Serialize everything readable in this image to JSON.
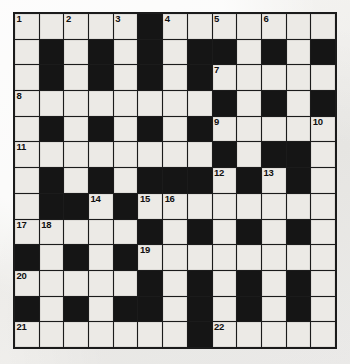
{
  "puzzle": {
    "title": "Crossword Grid",
    "type": "crossword",
    "rows": 13,
    "cols": 13,
    "colors": {
      "block": "#151515",
      "open_cell": "#eceae6",
      "border": "#1b1b1b",
      "page_background": "#f2f1ef",
      "number_text": "#101010"
    },
    "legend": {
      "open": "0 = open (white) cell where a letter is written",
      "block": "1 = blocked (black) cell"
    },
    "grid": [
      [
        0,
        0,
        0,
        0,
        0,
        1,
        0,
        0,
        0,
        0,
        0,
        0,
        0
      ],
      [
        0,
        1,
        0,
        1,
        0,
        1,
        0,
        1,
        1,
        0,
        1,
        0,
        1
      ],
      [
        0,
        1,
        0,
        1,
        0,
        1,
        0,
        1,
        0,
        0,
        0,
        0,
        0
      ],
      [
        0,
        0,
        0,
        0,
        0,
        0,
        0,
        0,
        1,
        0,
        1,
        0,
        1
      ],
      [
        0,
        1,
        0,
        1,
        0,
        1,
        0,
        1,
        0,
        0,
        0,
        0,
        0
      ],
      [
        0,
        0,
        0,
        0,
        0,
        0,
        0,
        0,
        1,
        0,
        1,
        1,
        0
      ],
      [
        0,
        1,
        0,
        1,
        0,
        1,
        1,
        1,
        0,
        1,
        0,
        1,
        0
      ],
      [
        0,
        1,
        1,
        0,
        1,
        0,
        0,
        0,
        0,
        0,
        0,
        0,
        0
      ],
      [
        0,
        0,
        0,
        0,
        0,
        1,
        0,
        1,
        0,
        1,
        0,
        1,
        0
      ],
      [
        1,
        0,
        1,
        0,
        1,
        0,
        0,
        0,
        0,
        0,
        0,
        0,
        0
      ],
      [
        0,
        0,
        0,
        0,
        0,
        1,
        0,
        1,
        0,
        1,
        0,
        1,
        0
      ],
      [
        1,
        0,
        1,
        0,
        1,
        1,
        0,
        1,
        0,
        1,
        0,
        1,
        0
      ],
      [
        0,
        0,
        0,
        0,
        0,
        0,
        0,
        1,
        0,
        0,
        0,
        0,
        0
      ]
    ],
    "numbers": [
      {
        "n": "1",
        "row": 0,
        "col": 0
      },
      {
        "n": "2",
        "row": 0,
        "col": 2
      },
      {
        "n": "3",
        "row": 0,
        "col": 4
      },
      {
        "n": "4",
        "row": 0,
        "col": 6
      },
      {
        "n": "5",
        "row": 0,
        "col": 8
      },
      {
        "n": "6",
        "row": 0,
        "col": 10
      },
      {
        "n": "7",
        "row": 2,
        "col": 8
      },
      {
        "n": "8",
        "row": 3,
        "col": 0
      },
      {
        "n": "9",
        "row": 4,
        "col": 8
      },
      {
        "n": "10",
        "row": 4,
        "col": 12
      },
      {
        "n": "11",
        "row": 5,
        "col": 0
      },
      {
        "n": "12",
        "row": 6,
        "col": 8
      },
      {
        "n": "13",
        "row": 6,
        "col": 10
      },
      {
        "n": "14",
        "row": 7,
        "col": 3
      },
      {
        "n": "15",
        "row": 7,
        "col": 5
      },
      {
        "n": "16",
        "row": 7,
        "col": 6
      },
      {
        "n": "17",
        "row": 8,
        "col": 0
      },
      {
        "n": "18",
        "row": 8,
        "col": 1
      },
      {
        "n": "19",
        "row": 9,
        "col": 5
      },
      {
        "n": "20",
        "row": 10,
        "col": 0
      },
      {
        "n": "21",
        "row": 12,
        "col": 0
      },
      {
        "n": "22",
        "row": 12,
        "col": 8
      }
    ]
  }
}
